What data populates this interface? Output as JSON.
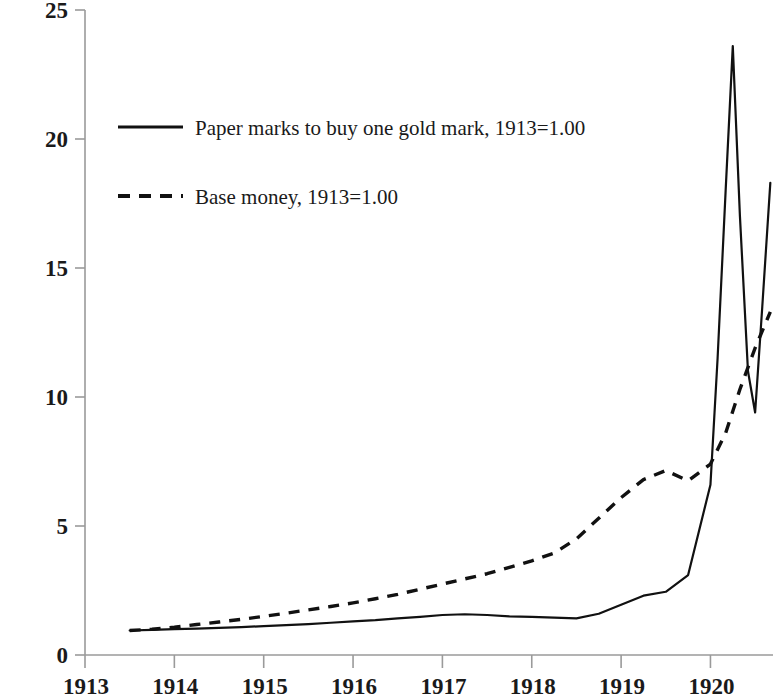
{
  "chart_data": {
    "type": "line",
    "title": "",
    "subtitle": "",
    "xlabel": "",
    "ylabel": "",
    "xlim": [
      1913.0,
      1920.7
    ],
    "ylim": [
      0,
      25
    ],
    "grid": false,
    "legend_position": "upper-left-inside",
    "x_tick_labels": [
      "1913",
      "1914",
      "1915",
      "1916",
      "1917",
      "1918",
      "1919",
      "1920"
    ],
    "x_ticks": [
      1913,
      1914,
      1915,
      1916,
      1917,
      1918,
      1919,
      1920
    ],
    "y_tick_labels": [
      "0",
      "5",
      "10",
      "15",
      "20",
      "25"
    ],
    "y_ticks": [
      0,
      5,
      10,
      15,
      20,
      25
    ],
    "series": [
      {
        "name": "Paper marks to buy one gold mark, 1913=1.00",
        "style": "solid",
        "color": "#000000",
        "x": [
          1913.5,
          1913.75,
          1914.0,
          1914.25,
          1914.5,
          1914.75,
          1915.0,
          1915.25,
          1915.5,
          1915.75,
          1916.0,
          1916.25,
          1916.5,
          1916.75,
          1917.0,
          1917.25,
          1917.5,
          1917.75,
          1918.0,
          1918.25,
          1918.5,
          1918.75,
          1919.0,
          1919.25,
          1919.5,
          1919.75,
          1920.0,
          1920.08,
          1920.17,
          1920.25,
          1920.33,
          1920.42,
          1920.5,
          1920.58,
          1920.67
        ],
        "y": [
          0.95,
          0.97,
          1.0,
          1.02,
          1.05,
          1.08,
          1.12,
          1.16,
          1.2,
          1.25,
          1.3,
          1.35,
          1.42,
          1.48,
          1.55,
          1.58,
          1.55,
          1.5,
          1.48,
          1.45,
          1.42,
          1.6,
          1.95,
          2.3,
          2.45,
          3.1,
          6.6,
          11.5,
          18.0,
          23.6,
          17.0,
          11.0,
          9.4,
          13.5,
          18.3
        ]
      },
      {
        "name": "Base money, 1913=1.00",
        "style": "dashed",
        "color": "#000000",
        "x": [
          1913.5,
          1913.75,
          1914.0,
          1914.25,
          1914.5,
          1914.75,
          1915.0,
          1915.25,
          1915.5,
          1915.75,
          1916.0,
          1916.25,
          1916.5,
          1916.75,
          1917.0,
          1917.25,
          1917.5,
          1917.75,
          1918.0,
          1918.25,
          1918.5,
          1918.75,
          1919.0,
          1919.25,
          1919.5,
          1919.75,
          1920.0,
          1920.17,
          1920.33,
          1920.5,
          1920.67
        ],
        "y": [
          0.95,
          1.0,
          1.08,
          1.18,
          1.28,
          1.38,
          1.5,
          1.62,
          1.75,
          1.88,
          2.02,
          2.18,
          2.35,
          2.55,
          2.75,
          2.95,
          3.15,
          3.4,
          3.65,
          3.95,
          4.5,
          5.3,
          6.1,
          6.8,
          7.15,
          6.75,
          7.4,
          8.6,
          10.3,
          11.9,
          13.3
        ]
      }
    ],
    "annotations": {
      "peak_value": 23.6,
      "peak_year": "1920",
      "trough_value": 9.4,
      "second_peak_value": 18.3
    }
  },
  "legend": {
    "entries": [
      {
        "label": "Paper marks to buy one gold mark, 1913=1.00",
        "style": "solid"
      },
      {
        "label": "Base money, 1913=1.00",
        "style": "dashed"
      }
    ]
  },
  "axes": {
    "y_labels": [
      "25",
      "20",
      "15",
      "10",
      "5",
      "0"
    ],
    "x_labels": [
      "1913",
      "1914",
      "1915",
      "1916",
      "1917",
      "1918",
      "1919",
      "1920"
    ]
  }
}
